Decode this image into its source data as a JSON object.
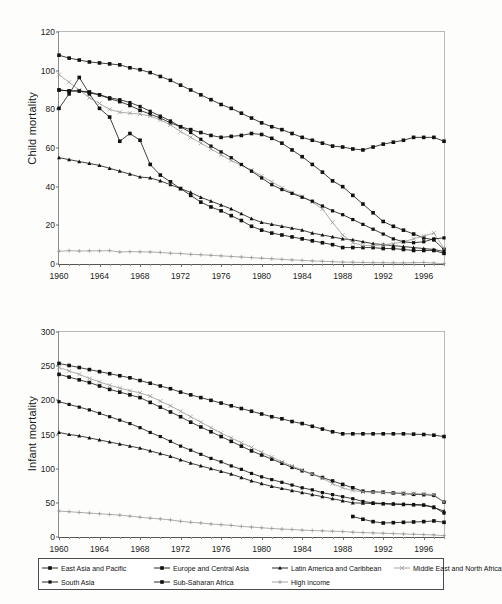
{
  "chart_data": [
    {
      "id": "child-mortality",
      "type": "line",
      "title": "",
      "ylabel": "Child mortality",
      "xlabel": "",
      "ylim": [
        0,
        120
      ],
      "yticks": [
        0,
        20,
        40,
        60,
        80,
        100,
        120
      ],
      "xlim": [
        1960,
        1998
      ],
      "xticks": [
        1960,
        1964,
        1968,
        1972,
        1976,
        1980,
        1984,
        1988,
        1992,
        1996
      ],
      "x": [
        1960,
        1961,
        1962,
        1963,
        1964,
        1965,
        1966,
        1967,
        1968,
        1969,
        1970,
        1971,
        1972,
        1973,
        1974,
        1975,
        1976,
        1977,
        1978,
        1979,
        1980,
        1981,
        1982,
        1983,
        1984,
        1985,
        1986,
        1987,
        1988,
        1989,
        1990,
        1991,
        1992,
        1993,
        1994,
        1995,
        1996,
        1997,
        1998
      ],
      "grid": false,
      "legend_position": "bottom-shared",
      "series": [
        {
          "name": "East Asia and Pacific",
          "marker": "diamond",
          "values": [
            80.5,
            88.0,
            96.5,
            88.0,
            80.5,
            76.0,
            63.5,
            67.5,
            64.0,
            51.5,
            46.0,
            42.5,
            39.0,
            35.5,
            32.0,
            29.5,
            27.5,
            25.0,
            22.5,
            19.5,
            17.5,
            16.0,
            15.0,
            14.0,
            13.0,
            12.0,
            11.0,
            10.0,
            8.5,
            8.5,
            8.5,
            8.5,
            8.0,
            8.0,
            7.5,
            7.0,
            7.0,
            7.0,
            5.5
          ]
        },
        {
          "name": "Europe and Central Asia",
          "marker": "square",
          "values": [
            90.0,
            89.5,
            89.5,
            89.0,
            87.5,
            85.5,
            84.0,
            82.0,
            79.5,
            77.5,
            75.5,
            73.0,
            71.0,
            69.5,
            68.0,
            66.5,
            65.5,
            66.0,
            66.5,
            67.5,
            67.0,
            65.0,
            62.5,
            59.0,
            55.5,
            51.5,
            47.5,
            43.0,
            40.0,
            35.5,
            31.0,
            26.5,
            22.0,
            19.5,
            17.5,
            15.5,
            13.5,
            12.5,
            7.5
          ]
        },
        {
          "name": "Latin America and Caribbean",
          "marker": "triangle",
          "values": [
            55.0,
            54.0,
            53.0,
            52.0,
            51.0,
            49.5,
            48.0,
            46.5,
            45.0,
            44.5,
            43.0,
            41.0,
            39.0,
            37.0,
            34.5,
            32.5,
            30.5,
            28.5,
            26.0,
            23.5,
            21.5,
            20.5,
            19.5,
            18.5,
            17.5,
            16.0,
            15.0,
            14.0,
            13.0,
            12.5,
            11.5,
            10.5,
            10.0,
            9.5,
            9.0,
            8.5,
            8.0,
            7.5,
            6.5
          ]
        },
        {
          "name": "Middle East and North Africa",
          "marker": "cross",
          "values": [
            98.0,
            94.0,
            90.0,
            86.0,
            83.0,
            80.0,
            78.5,
            78.0,
            77.5,
            76.5,
            74.5,
            72.0,
            68.5,
            65.5,
            62.5,
            59.5,
            56.5,
            53.5,
            51.0,
            48.5,
            45.5,
            42.5,
            39.5,
            37.0,
            35.0,
            32.0,
            28.5,
            21.5,
            15.0,
            11.0,
            9.5,
            9.5,
            10.0,
            10.5,
            11.5,
            13.0,
            14.5,
            16.0,
            8.0
          ]
        },
        {
          "name": "South Asia",
          "marker": "square-small",
          "values": [
            90.0,
            89.5,
            89.5,
            88.5,
            87.5,
            86.0,
            85.0,
            83.5,
            81.5,
            79.0,
            76.5,
            74.0,
            71.0,
            68.0,
            64.5,
            61.0,
            58.0,
            55.0,
            51.5,
            48.0,
            44.5,
            41.0,
            38.5,
            36.5,
            34.5,
            32.5,
            30.0,
            27.5,
            25.5,
            23.0,
            20.5,
            18.0,
            15.5,
            13.0,
            11.5,
            11.0,
            11.5,
            13.0,
            13.5
          ]
        },
        {
          "name": "Sub-Saharan Africa",
          "marker": "diamond",
          "values": [
            108.0,
            106.5,
            105.5,
            104.5,
            104.0,
            103.5,
            103.0,
            101.5,
            100.5,
            99.0,
            97.0,
            95.0,
            92.5,
            90.0,
            87.5,
            85.0,
            82.5,
            80.5,
            78.0,
            75.5,
            73.0,
            71.0,
            69.5,
            67.5,
            65.5,
            64.0,
            62.5,
            61.0,
            60.5,
            59.5,
            59.0,
            60.5,
            62.0,
            63.0,
            64.0,
            65.5,
            65.5,
            65.5,
            63.5
          ]
        },
        {
          "name": "High income",
          "marker": "plus",
          "values": [
            6.6,
            6.9,
            6.7,
            6.8,
            6.8,
            6.9,
            6.2,
            6.4,
            6.3,
            6.2,
            6.0,
            5.6,
            5.4,
            5.0,
            4.8,
            4.5,
            4.2,
            3.9,
            3.6,
            3.3,
            3.0,
            2.7,
            2.4,
            2.1,
            1.9,
            1.6,
            1.4,
            1.2,
            1.0,
            0.9,
            0.8,
            0.7,
            0.7,
            0.6,
            0.6,
            0.7,
            0.8,
            0.5,
            0.2
          ]
        }
      ]
    },
    {
      "id": "infant-mortality",
      "type": "line",
      "title": "",
      "ylabel": "Infant mortality",
      "xlabel": "",
      "ylim": [
        0,
        300
      ],
      "yticks": [
        0,
        50,
        100,
        150,
        200,
        250,
        300
      ],
      "xlim": [
        1960,
        1998
      ],
      "xticks": [
        1960,
        1964,
        1968,
        1972,
        1976,
        1980,
        1984,
        1988,
        1992,
        1996
      ],
      "x": [
        1960,
        1961,
        1962,
        1963,
        1964,
        1965,
        1966,
        1967,
        1968,
        1969,
        1970,
        1971,
        1972,
        1973,
        1974,
        1975,
        1976,
        1977,
        1978,
        1979,
        1980,
        1981,
        1982,
        1983,
        1984,
        1985,
        1986,
        1987,
        1988,
        1989,
        1990,
        1991,
        1992,
        1993,
        1994,
        1995,
        1996,
        1997,
        1998
      ],
      "grid": false,
      "legend_position": "bottom-shared",
      "series": [
        {
          "name": "East Asia and Pacific",
          "marker": "diamond",
          "values": [
            238.0,
            234.0,
            230.0,
            226.0,
            221.0,
            216.0,
            212.0,
            208.0,
            204.0,
            197.0,
            190.0,
            183.0,
            176.0,
            168.0,
            161.0,
            154.0,
            147.0,
            140.0,
            133.0,
            126.0,
            120.0,
            114.0,
            108.0,
            102.0,
            97.0,
            92.0,
            87.0,
            82.0,
            77.0,
            72.0,
            67.0,
            66.0,
            65.5,
            64.5,
            63.5,
            62.5,
            62.0,
            61.0,
            51.0
          ]
        },
        {
          "name": "Europe and Central Asia",
          "marker": "square",
          "values": [
            null,
            null,
            null,
            null,
            null,
            null,
            null,
            null,
            null,
            null,
            null,
            null,
            null,
            null,
            null,
            null,
            null,
            null,
            null,
            null,
            null,
            null,
            null,
            null,
            null,
            null,
            null,
            null,
            null,
            30.0,
            26.0,
            22.5,
            20.5,
            21.0,
            21.5,
            22.0,
            22.5,
            23.5,
            21.5
          ]
        },
        {
          "name": "Latin America and Caribbean",
          "marker": "triangle",
          "values": [
            153.0,
            150.0,
            148.0,
            145.0,
            142.0,
            139.0,
            136.0,
            133.0,
            130.0,
            126.0,
            122.0,
            118.0,
            113.0,
            108.0,
            104.0,
            100.0,
            96.0,
            92.0,
            87.0,
            82.0,
            78.0,
            74.0,
            71.0,
            68.0,
            65.0,
            62.0,
            59.0,
            56.0,
            53.0,
            50.0,
            49.5,
            49.0,
            48.5,
            48.0,
            47.5,
            47.0,
            46.5,
            43.0,
            38.0
          ]
        },
        {
          "name": "Middle East and North Africa",
          "marker": "cross",
          "values": [
            248.0,
            243.0,
            238.0,
            232.0,
            227.0,
            222.0,
            218.0,
            214.0,
            211.0,
            206.0,
            199.0,
            192.0,
            184.0,
            176.0,
            168.0,
            160.0,
            152.0,
            145.0,
            138.0,
            131.0,
            124.0,
            117.0,
            110.0,
            104.0,
            98.0,
            92.0,
            86.0,
            78.0,
            72.0,
            68.0,
            66.0,
            65.5,
            65.0,
            64.5,
            64.0,
            63.5,
            63.0,
            62.0,
            51.0
          ]
        },
        {
          "name": "South Asia",
          "marker": "square-small",
          "values": [
            198.0,
            194.0,
            190.0,
            186.0,
            181.0,
            176.0,
            171.0,
            166.0,
            160.0,
            153.0,
            147.0,
            140.0,
            133.0,
            127.0,
            121.0,
            115.0,
            110.0,
            104.0,
            99.0,
            93.0,
            88.0,
            84.0,
            80.0,
            76.0,
            72.0,
            69.0,
            65.0,
            62.0,
            59.0,
            56.0,
            52.0,
            50.0,
            49.0,
            48.5,
            48.0,
            47.5,
            47.0,
            44.0,
            35.0
          ]
        },
        {
          "name": "Sub-Saharan Africa",
          "marker": "diamond",
          "values": [
            254.0,
            251.0,
            248.0,
            245.0,
            242.0,
            239.0,
            236.0,
            233.0,
            229.0,
            225.0,
            221.0,
            217.0,
            212.0,
            208.0,
            204.0,
            200.0,
            196.0,
            192.0,
            188.0,
            184.0,
            180.0,
            176.0,
            173.0,
            169.0,
            166.0,
            162.0,
            158.0,
            154.0,
            151.0,
            151.0,
            151.0,
            151.0,
            151.0,
            151.0,
            151.0,
            150.5,
            150.0,
            149.0,
            147.0
          ]
        },
        {
          "name": "High income",
          "marker": "plus",
          "values": [
            38.0,
            37.0,
            36.0,
            35.0,
            34.0,
            33.0,
            32.0,
            30.5,
            29.0,
            27.5,
            26.5,
            25.0,
            23.0,
            21.5,
            20.5,
            19.0,
            18.0,
            17.0,
            15.5,
            14.5,
            13.5,
            12.5,
            11.5,
            11.0,
            10.0,
            9.5,
            9.0,
            8.5,
            8.0,
            7.0,
            6.5,
            6.0,
            5.5,
            5.0,
            4.5,
            4.0,
            3.5,
            3.0,
            2.0
          ]
        }
      ]
    }
  ],
  "legend": {
    "items": [
      {
        "label": "East Asia and Pacific",
        "marker": "diamond"
      },
      {
        "label": "Europe and Central Asia",
        "marker": "square"
      },
      {
        "label": "Latin America and Caribbean",
        "marker": "triangle"
      },
      {
        "label": "Middle East and North Africa",
        "marker": "cross"
      },
      {
        "label": "South Asia",
        "marker": "square-small"
      },
      {
        "label": "Sub-Saharan Africa",
        "marker": "diamond"
      },
      {
        "label": "High income",
        "marker": "plus"
      }
    ]
  },
  "colors": {
    "ink": "#111111",
    "axis": "#6d6d6d",
    "light_series": "#9a9a9a",
    "background": "#fdfdfb"
  }
}
